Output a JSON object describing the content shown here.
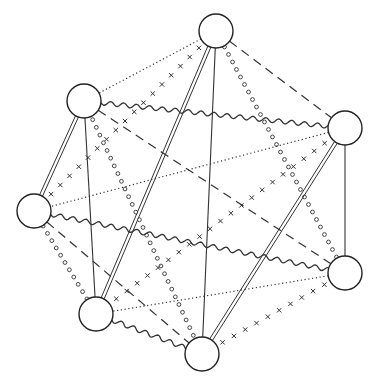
{
  "diagram": {
    "caption_cutoff": "",
    "colors": {
      "stroke": "#333333",
      "node_stroke": "#222222",
      "node_fill": "#ffffff",
      "background": "#ffffff"
    },
    "node_radius": 17,
    "nodes": [
      {
        "id": "top",
        "x": 216,
        "y": 31
      },
      {
        "id": "upper-left",
        "x": 84,
        "y": 101
      },
      {
        "id": "right",
        "x": 345,
        "y": 128
      },
      {
        "id": "left",
        "x": 34,
        "y": 211
      },
      {
        "id": "lower-right",
        "x": 345,
        "y": 273
      },
      {
        "id": "lower-left",
        "x": 96,
        "y": 314
      },
      {
        "id": "bottom",
        "x": 202,
        "y": 354
      }
    ],
    "edge_styles": [
      "solid",
      "double",
      "dotted",
      "dashed",
      "wavy",
      "circles",
      "crosses"
    ],
    "edges": [
      {
        "from": "top",
        "to": "upper-left",
        "style": "dotted"
      },
      {
        "from": "top",
        "to": "left",
        "style": "crosses"
      },
      {
        "from": "top",
        "to": "lower-left",
        "style": "double"
      },
      {
        "from": "top",
        "to": "bottom",
        "style": "solid"
      },
      {
        "from": "top",
        "to": "lower-right",
        "style": "circles"
      },
      {
        "from": "top",
        "to": "right",
        "style": "dashed"
      },
      {
        "from": "upper-left",
        "to": "right",
        "style": "wavy"
      },
      {
        "from": "upper-left",
        "to": "left",
        "style": "double"
      },
      {
        "from": "upper-left",
        "to": "lower-left",
        "style": "solid"
      },
      {
        "from": "upper-left",
        "to": "bottom",
        "style": "circles"
      },
      {
        "from": "upper-left",
        "to": "lower-right",
        "style": "dashed"
      },
      {
        "from": "right",
        "to": "left",
        "style": "dotted"
      },
      {
        "from": "right",
        "to": "lower-left",
        "style": "crosses"
      },
      {
        "from": "right",
        "to": "bottom",
        "style": "double"
      },
      {
        "from": "right",
        "to": "lower-right",
        "style": "solid"
      },
      {
        "from": "left",
        "to": "lower-right",
        "style": "wavy"
      },
      {
        "from": "left",
        "to": "bottom",
        "style": "dashed"
      },
      {
        "from": "left",
        "to": "lower-left",
        "style": "circles"
      },
      {
        "from": "lower-right",
        "to": "lower-left",
        "style": "dotted"
      },
      {
        "from": "lower-right",
        "to": "bottom",
        "style": "crosses"
      },
      {
        "from": "lower-left",
        "to": "bottom",
        "style": "wavy"
      }
    ]
  }
}
